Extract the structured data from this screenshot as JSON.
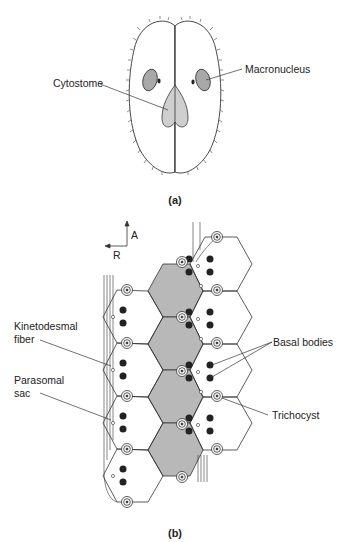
{
  "panel_a": {
    "caption": "(a)",
    "labels": {
      "cytostome": "Cytostome",
      "macronucleus": "Macronucleus"
    }
  },
  "panel_b": {
    "caption": "(b)",
    "axis": {
      "anterior": "A",
      "right": "R"
    },
    "labels": {
      "kinetodesmal_line1": "Kinetodesmal",
      "kinetodesmal_line2": "fiber",
      "parasomal_line1": "Parasomal",
      "parasomal_line2": "sac",
      "basal_bodies": "Basal bodies",
      "trichocyst": "Trichocyst"
    }
  },
  "colors": {
    "outline": "#333333",
    "shaded_cell": "#b8b8b8",
    "nucleus": "#a8a8a8",
    "cytostome": "#cfcfcf",
    "basal_body": "#222222"
  }
}
